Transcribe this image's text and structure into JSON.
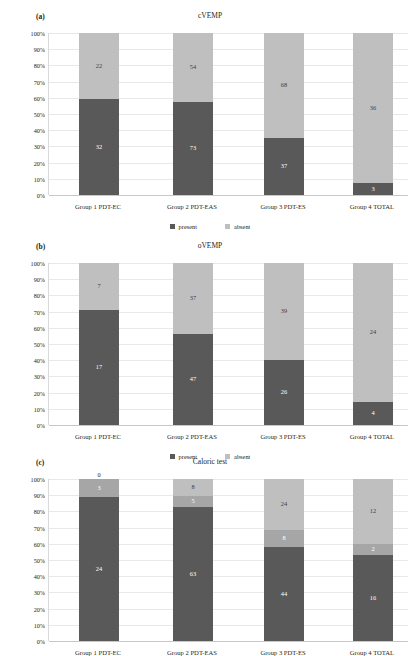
{
  "figure": {
    "width": 420,
    "height": 656,
    "colors": {
      "dark": "#595959",
      "mid": "#a6a6a6",
      "light": "#bfbfbf",
      "grid": "#e8e8e8",
      "axis": "#c8c8c8",
      "text": "#231f20"
    },
    "yticks": [
      "100%",
      "90%",
      "80%",
      "70%",
      "60%",
      "50%",
      "40%",
      "30%",
      "20%",
      "10%",
      "0%"
    ]
  },
  "panels": [
    {
      "tag": "(a)",
      "title": "cVEMP",
      "legend": [
        "present",
        "absent"
      ]
    },
    {
      "tag": "(b)",
      "title": "oVEMP",
      "legend": [
        "present",
        "absent"
      ]
    },
    {
      "tag": "(c)",
      "title": "Caloric test",
      "legend": [
        "normal",
        "weakness",
        "areflexia"
      ]
    }
  ],
  "chart_data": [
    {
      "type": "bar",
      "stacked": true,
      "normalized": true,
      "title": "cVEMP",
      "panel": "(a)",
      "xlabel": "",
      "ylabel": "",
      "ylim": [
        0,
        100
      ],
      "ytick_labels": [
        "0%",
        "10%",
        "20%",
        "30%",
        "40%",
        "50%",
        "60%",
        "70%",
        "80%",
        "90%",
        "100%"
      ],
      "grid": true,
      "legend_position": "bottom",
      "categories": [
        "Group 1 PDT-EC",
        "Group 2 PDT-EAS",
        "Group 3 PDT-ES",
        "Group 4 TOTAL"
      ],
      "series": [
        {
          "name": "present",
          "color": "#595959",
          "values": [
            32,
            73,
            37,
            3
          ]
        },
        {
          "name": "absent",
          "color": "#bfbfbf",
          "values": [
            22,
            54,
            68,
            36
          ]
        }
      ]
    },
    {
      "type": "bar",
      "stacked": true,
      "normalized": true,
      "title": "oVEMP",
      "panel": "(b)",
      "xlabel": "",
      "ylabel": "",
      "ylim": [
        0,
        100
      ],
      "ytick_labels": [
        "0%",
        "10%",
        "20%",
        "30%",
        "40%",
        "50%",
        "60%",
        "70%",
        "80%",
        "90%",
        "100%"
      ],
      "grid": true,
      "legend_position": "bottom",
      "categories": [
        "Group 1 PDT-EC",
        "Group 2 PDT-EAS",
        "Group 3 PDT-ES",
        "Group 4 TOTAL"
      ],
      "series": [
        {
          "name": "present",
          "color": "#595959",
          "values": [
            17,
            47,
            26,
            4
          ]
        },
        {
          "name": "absent",
          "color": "#bfbfbf",
          "values": [
            7,
            37,
            39,
            24
          ]
        }
      ]
    },
    {
      "type": "bar",
      "stacked": true,
      "normalized": true,
      "title": "Caloric test",
      "panel": "(c)",
      "xlabel": "",
      "ylabel": "",
      "ylim": [
        0,
        100
      ],
      "ytick_labels": [
        "0%",
        "10%",
        "20%",
        "30%",
        "40%",
        "50%",
        "60%",
        "70%",
        "80%",
        "90%",
        "100%"
      ],
      "grid": true,
      "legend_position": "bottom",
      "categories": [
        "Group 1 PDT-EC",
        "Group 2 PDT-EAS",
        "Group 3 PDT-ES",
        "Group 4 TOTAL"
      ],
      "series": [
        {
          "name": "normal",
          "color": "#595959",
          "values": [
            24,
            63,
            44,
            16
          ]
        },
        {
          "name": "weakness",
          "color": "#a6a6a6",
          "values": [
            3,
            5,
            8,
            2
          ]
        },
        {
          "name": "areflexia",
          "color": "#bfbfbf",
          "values": [
            0,
            8,
            24,
            12
          ]
        }
      ]
    }
  ]
}
